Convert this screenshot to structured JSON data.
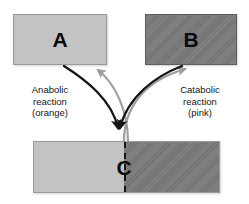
{
  "diagram": {
    "background_color": "#ffffff",
    "boxes": [
      {
        "id": "A",
        "label": "A",
        "fill_color": "#c3c3c3",
        "border_color": "#9a9a9a",
        "pattern": "solid",
        "role": "reactant-product-a"
      },
      {
        "id": "B",
        "label": "B",
        "fill_color": "#787878",
        "border_color": "#5d5d5d",
        "pattern": "diagonal-hatch",
        "role": "reactant-product-b"
      },
      {
        "id": "C",
        "label": "C",
        "fill_color_left": "#c3c3c3",
        "fill_color_right": "#787878",
        "border_color": "#9a9a9a",
        "pattern": "split-half-hatch",
        "divider_style": "dashed",
        "divider_color": "#151515",
        "role": "combined-molecule-c"
      }
    ],
    "captions": {
      "anabolic": {
        "line1": "Anabolic",
        "line2": "reaction",
        "line3": "(orange)"
      },
      "catabolic": {
        "line1": "Catabolic",
        "line2": "reaction",
        "line3": "(pink)"
      }
    },
    "arrows": [
      {
        "name": "arrow-a-to-c",
        "from": "A",
        "to": "C",
        "direction": "down",
        "color": "#151515",
        "semantic_color": "orange",
        "reaction": "anabolic"
      },
      {
        "name": "arrow-b-to-c",
        "from": "B",
        "to": "C",
        "direction": "down",
        "color": "#151515",
        "semantic_color": "orange",
        "reaction": "anabolic"
      },
      {
        "name": "arrow-c-to-a",
        "from": "C",
        "to": "A",
        "direction": "up",
        "color": "#9d9d9d",
        "semantic_color": "pink",
        "reaction": "catabolic"
      },
      {
        "name": "arrow-c-to-b",
        "from": "C",
        "to": "B",
        "direction": "up",
        "color": "#9d9d9d",
        "semantic_color": "pink",
        "reaction": "catabolic"
      }
    ]
  }
}
